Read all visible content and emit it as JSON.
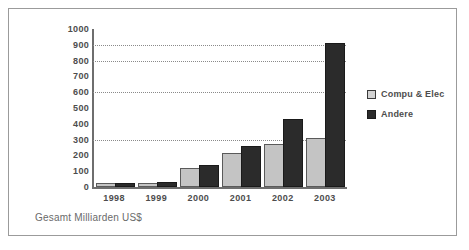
{
  "chart_data": {
    "type": "bar",
    "title": "",
    "subtitle": "",
    "xlabel": "",
    "ylabel": "",
    "footnote": "Gesamt Milliarden US$",
    "categories": [
      "1998",
      "1999",
      "2000",
      "2001",
      "2002",
      "2003"
    ],
    "series": [
      {
        "name": "Compu & Elec",
        "color": "#c4c4c4",
        "values": [
          5,
          12,
          110,
          205,
          260,
          300
        ]
      },
      {
        "name": "Andere",
        "color": "#2b2b2b",
        "values": [
          8,
          22,
          125,
          250,
          420,
          900
        ]
      }
    ],
    "ylim": [
      0,
      1000
    ],
    "ytick_step": 100,
    "yticks": [
      "1000",
      "900",
      "800",
      "700",
      "600",
      "500",
      "400",
      "300",
      "200",
      "100",
      "0"
    ],
    "gridlines_at": [
      900,
      800,
      600,
      300
    ],
    "grid": true,
    "legend_position": "right"
  },
  "legend": {
    "items": [
      {
        "label": "Compu & Elec"
      },
      {
        "label": "Andere"
      }
    ]
  },
  "footer": {
    "text": "Gesamt Milliarden US$"
  }
}
